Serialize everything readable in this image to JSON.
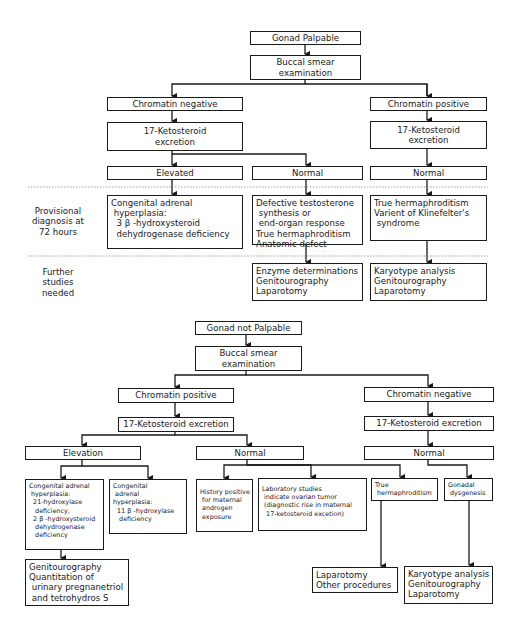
{
  "top": {
    "root": "Gonad Palpable",
    "smear": "Buccal smear\nexamination",
    "neg": "Chromatin negative",
    "neg_keto": "17-Ketosteroid\nexcretion",
    "pos": "Chromatin positive",
    "pos_keto": "17-Ketosteroid\nexcretion",
    "elevated": "Elevated",
    "normal_mid": "Normal",
    "normal_right": "Normal",
    "row_labels": {
      "provisional": "Provisional\ndiagnosis at\n72 hours",
      "further": "Further\nstudies\nneeded"
    },
    "diag_left": "Congenital adrenal\n hyperplasia:\n  3 β -hydroxysteroid\n  dehydrogenase deficiency",
    "diag_mid": "Defective testosterone\n synthesis or\n end-organ response\nTrue hermaphroditism\nAnatomic defect",
    "diag_right": "True hermaphroditism\nVarient of Klinefelter's\n syndrome",
    "study_mid": "Enzyme determinations\nGenitourography\nLaparotomy",
    "study_right": "Karyotype analysis\nGenitourography\nLaparotomy"
  },
  "bottom": {
    "root": "Gonad not Palpable",
    "smear": "Buccal smear\nexamination",
    "pos": "Chromatin positive",
    "pos_keto": "17-Ketosteroid excretion",
    "neg": "Chromatin negative",
    "neg_keto": "17-Ketosteroid excretion",
    "elevation": "Elevation",
    "normal_mid": "Normal",
    "normal_right": "Normal",
    "cah_21": "Congenital adrenal\n hyperplasia:\n  21-hydroxylase\n   deficiency,\n  2 β -hydroxysteroid\n   dehydrogenase\n   deficiency",
    "cah_11": "Congenital\n adrenal\nhyperplasia:\n  11 β -hydroxylase\n   deficiency",
    "history": "History positive\n for maternal\n androgen\n exposure",
    "lab": "Laboratory studies\n indicate ovarian tumor\n (diagnostic rise in maternal\n  17-ketosteroid excetion)",
    "true_herm": "True\n hermaphroditism",
    "gonadal": "Gonadal\n dysgenesis",
    "geni_left": "Genitourography\nQuantitation of\n urinary pregnanetriol\n and tetrohydros S",
    "laparotomy": "Laparotomy\nOther procedures",
    "karyotype": "Karyotype analysis\nGenitourography\nLaparotomy"
  }
}
